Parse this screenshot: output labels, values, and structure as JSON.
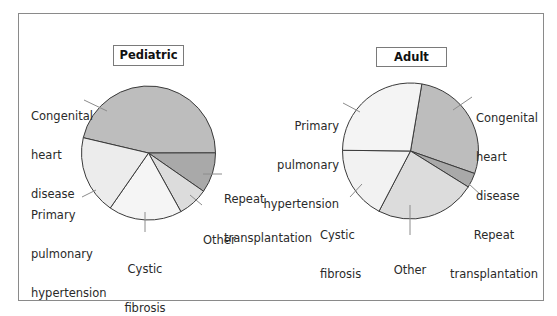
{
  "chart_data": [
    {
      "type": "pie",
      "title": "Pediatric",
      "slices": [
        {
          "label": "Congenital heart disease",
          "value": 46.3,
          "color": "#bdbdbd"
        },
        {
          "label": "Repeat transplantation",
          "value": 9.7,
          "color": "#a9a9a9"
        },
        {
          "label": "Other",
          "value": 7.3,
          "color": "#dcdcdc"
        },
        {
          "label": "Cystic fibrosis",
          "value": 17.7,
          "color": "#f5f5f5"
        },
        {
          "label": "Primary pulmonary hypertension",
          "value": 19.0,
          "color": "#ececec"
        }
      ],
      "start_angle_deg": 283.2,
      "units": "percent (estimated from slice angles)"
    },
    {
      "type": "pie",
      "title": "Adult",
      "slices": [
        {
          "label": "Congenital heart disease",
          "value": 27.7,
          "color": "#bdbdbd"
        },
        {
          "label": "Repeat transplantation",
          "value": 3.5,
          "color": "#a9a9a9"
        },
        {
          "label": "Other",
          "value": 23.8,
          "color": "#dcdcdc"
        },
        {
          "label": "Cystic fibrosis",
          "value": 17.5,
          "color": "#f2f2f2"
        },
        {
          "label": "Primary pulmonary hypertension",
          "value": 27.5,
          "color": "#f4f4f4"
        }
      ],
      "start_angle_deg": 9.6,
      "units": "percent (estimated from slice angles)"
    }
  ],
  "pediatric": {
    "title": "Pediatric",
    "labels": {
      "congenital": [
        "Congenital",
        "heart",
        "disease"
      ],
      "pph": [
        "Primary",
        "pulmonary",
        "hypertension"
      ],
      "cf": [
        "Cystic",
        "fibrosis"
      ],
      "other": [
        "Other"
      ],
      "repeat": [
        "Repeat",
        "transplantation"
      ]
    }
  },
  "adult": {
    "title": "Adult",
    "labels": {
      "congenital": [
        "Congenital",
        "heart",
        "disease"
      ],
      "pph": [
        "Primary",
        "pulmonary",
        "hypertension"
      ],
      "cf": [
        "Cystic",
        "fibrosis"
      ],
      "other": [
        "Other"
      ],
      "repeat": [
        "Repeat",
        "transplantation"
      ]
    }
  },
  "style": {
    "slice_stroke": "#3a3a3a",
    "leader_stroke": "#8c8c8c"
  }
}
